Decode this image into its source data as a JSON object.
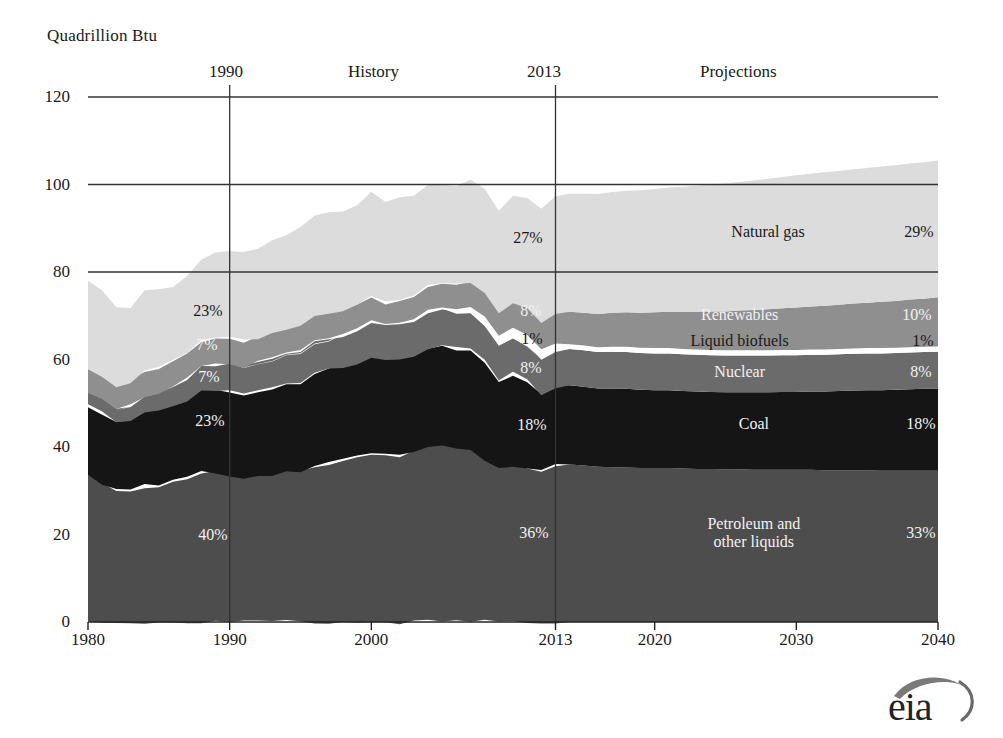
{
  "chart_data": {
    "type": "area",
    "title": "",
    "ylabel": "Quadrillion Btu",
    "xlabel": "",
    "ylim": [
      0,
      120
    ],
    "xlim": [
      1980,
      2040
    ],
    "yticks": [
      "0",
      "20",
      "40",
      "60",
      "80",
      "100",
      "120"
    ],
    "xticks": [
      "1980",
      "1990",
      "2000",
      "2013",
      "2020",
      "2030",
      "2040"
    ],
    "grid": "horizontal-sparse",
    "legend": "inline-band-labels",
    "stack_order_bottom_to_top": [
      "Petroleum and other liquids",
      "Coal",
      "Nuclear",
      "Liquid biofuels",
      "Renewables",
      "Natural gas"
    ],
    "x": [
      1980,
      1981,
      1982,
      1983,
      1984,
      1985,
      1986,
      1987,
      1988,
      1989,
      1990,
      1991,
      1992,
      1993,
      1994,
      1995,
      1996,
      1997,
      1998,
      1999,
      2000,
      2001,
      2002,
      2003,
      2004,
      2005,
      2006,
      2007,
      2008,
      2009,
      2010,
      2011,
      2012,
      2013,
      2014,
      2015,
      2016,
      2017,
      2018,
      2019,
      2020,
      2021,
      2022,
      2023,
      2024,
      2025,
      2026,
      2027,
      2028,
      2029,
      2030,
      2031,
      2032,
      2033,
      2034,
      2035,
      2036,
      2037,
      2038,
      2039,
      2040
    ],
    "series": [
      {
        "name": "Petroleum and other liquids",
        "color": "#4d4d4d",
        "label_color": "light",
        "values": [
          34.2,
          31.9,
          30.2,
          30.1,
          31.0,
          30.9,
          32.2,
          32.9,
          34.2,
          34.2,
          33.6,
          32.8,
          33.5,
          33.8,
          34.6,
          34.4,
          35.7,
          36.3,
          36.8,
          37.8,
          38.3,
          38.2,
          38.2,
          38.8,
          40.3,
          40.4,
          39.9,
          39.8,
          37.1,
          35.3,
          36.0,
          35.3,
          34.7,
          35.9,
          36.0,
          35.8,
          35.5,
          35.4,
          35.3,
          35.2,
          35.2,
          35.2,
          35.1,
          35.0,
          35.0,
          34.9,
          34.9,
          34.8,
          34.8,
          34.8,
          34.8,
          34.8,
          34.7,
          34.7,
          34.7,
          34.7,
          34.6,
          34.6,
          34.6,
          34.6,
          34.6
        ]
      },
      {
        "name": "Coal",
        "color": "#151515",
        "label_color": "light",
        "values": [
          15.4,
          16.0,
          15.3,
          15.9,
          17.1,
          17.5,
          17.3,
          18.0,
          18.8,
          19.1,
          19.2,
          19.0,
          19.1,
          19.8,
          19.9,
          20.1,
          21.0,
          21.4,
          21.7,
          21.6,
          22.6,
          21.9,
          21.9,
          22.3,
          22.5,
          22.8,
          22.4,
          22.7,
          22.4,
          19.7,
          20.8,
          19.7,
          17.4,
          18.0,
          18.1,
          18.0,
          17.9,
          18.0,
          18.0,
          17.9,
          17.8,
          17.8,
          17.7,
          17.7,
          17.6,
          17.6,
          17.6,
          17.7,
          17.7,
          17.8,
          17.8,
          17.9,
          18.0,
          18.1,
          18.2,
          18.3,
          18.4,
          18.5,
          18.6,
          18.7,
          18.8
        ]
      },
      {
        "name": "Nuclear",
        "color": "#6b6b6b",
        "label_color": "light",
        "values": [
          2.7,
          3.0,
          3.1,
          3.2,
          3.6,
          4.1,
          4.4,
          4.9,
          5.6,
          5.7,
          6.1,
          6.4,
          6.5,
          6.5,
          6.8,
          7.1,
          7.2,
          6.7,
          7.1,
          7.6,
          7.9,
          8.0,
          8.1,
          7.9,
          8.2,
          8.2,
          8.2,
          8.4,
          8.4,
          8.4,
          8.4,
          8.3,
          8.1,
          8.3,
          8.3,
          8.3,
          8.3,
          8.4,
          8.4,
          8.4,
          8.4,
          8.4,
          8.4,
          8.4,
          8.4,
          8.4,
          8.4,
          8.4,
          8.4,
          8.4,
          8.4,
          8.4,
          8.4,
          8.4,
          8.4,
          8.4,
          8.4,
          8.4,
          8.4,
          8.4,
          8.4
        ]
      },
      {
        "name": "Liquid biofuels",
        "color": "#ffffff",
        "label_color": "dark",
        "values": [
          0.0,
          0.0,
          0.0,
          0.1,
          0.1,
          0.1,
          0.1,
          0.1,
          0.1,
          0.1,
          0.1,
          0.1,
          0.1,
          0.1,
          0.1,
          0.2,
          0.2,
          0.2,
          0.2,
          0.2,
          0.2,
          0.2,
          0.3,
          0.4,
          0.5,
          0.6,
          0.8,
          1.0,
          1.4,
          1.5,
          1.7,
          1.8,
          1.8,
          1.1,
          1.1,
          1.1,
          1.1,
          1.1,
          1.2,
          1.2,
          1.2,
          1.2,
          1.2,
          1.2,
          1.2,
          1.2,
          1.2,
          1.2,
          1.2,
          1.2,
          1.2,
          1.2,
          1.2,
          1.2,
          1.2,
          1.2,
          1.2,
          1.2,
          1.2,
          1.2,
          1.2
        ]
      },
      {
        "name": "Renewables",
        "color": "#8f8f8f",
        "label_color": "light",
        "values": [
          5.5,
          5.2,
          5.6,
          5.8,
          5.8,
          5.7,
          5.8,
          5.5,
          5.4,
          5.7,
          5.8,
          5.8,
          5.6,
          5.9,
          5.7,
          6.0,
          6.2,
          5.9,
          5.4,
          5.4,
          5.2,
          4.5,
          5.0,
          5.1,
          5.2,
          5.4,
          5.6,
          5.7,
          6.0,
          6.1,
          6.3,
          6.9,
          6.6,
          7.4,
          7.4,
          7.5,
          7.6,
          7.8,
          7.9,
          8.0,
          8.2,
          8.3,
          8.5,
          8.6,
          8.8,
          8.9,
          9.1,
          9.2,
          9.4,
          9.5,
          9.7,
          9.8,
          10.0,
          10.1,
          10.3,
          10.4,
          10.6,
          10.7,
          10.9,
          11.0,
          11.2
        ]
      },
      {
        "name": "Natural gas",
        "color": "#dcdcdc",
        "label_color": "dark",
        "values": [
          20.2,
          19.8,
          18.3,
          17.2,
          18.3,
          17.7,
          16.6,
          17.6,
          18.4,
          19.4,
          19.6,
          20.0,
          20.7,
          21.2,
          21.6,
          22.6,
          23.0,
          23.2,
          22.8,
          22.7,
          23.8,
          22.7,
          23.5,
          22.8,
          22.9,
          22.5,
          22.2,
          23.6,
          23.8,
          23.4,
          24.6,
          25.1,
          26.1,
          26.9,
          27.0,
          27.2,
          27.4,
          27.6,
          27.8,
          28.0,
          28.2,
          28.4,
          28.6,
          28.8,
          29.0,
          29.2,
          29.4,
          29.6,
          29.8,
          30.0,
          30.2,
          30.4,
          30.5,
          30.6,
          30.7,
          30.8,
          30.9,
          31.0,
          31.1,
          31.2,
          31.3
        ]
      }
    ],
    "share_labels": {
      "1990": {
        "natural_gas": "23%",
        "renewables": "7%",
        "nuclear": "7%",
        "coal": "23%",
        "petroleum": "40%"
      },
      "2013": {
        "natural_gas": "27%",
        "renewables": "8%",
        "liquid_biofuels": "1%",
        "nuclear": "8%",
        "coal": "18%",
        "petroleum": "36%"
      },
      "2040": {
        "natural_gas": "29%",
        "renewables": "10%",
        "liquid_biofuels": "1%",
        "nuclear": "8%",
        "coal": "18%",
        "petroleum": "33%"
      }
    },
    "annotations": {
      "history_label": "History",
      "projections_label": "Projections",
      "divider_years": [
        "1990",
        "2013"
      ]
    }
  },
  "axis": {
    "y_title": "Quadrillion Btu"
  },
  "band_names": {
    "natural_gas": "Natural gas",
    "renewables": "Renewables",
    "liquid_biofuels": "Liquid biofuels",
    "nuclear": "Nuclear",
    "coal": "Coal",
    "petroleum_line1": "Petroleum and",
    "petroleum_line2": "other liquids"
  },
  "logo": {
    "text": "eia",
    "name": "eia-logo"
  }
}
